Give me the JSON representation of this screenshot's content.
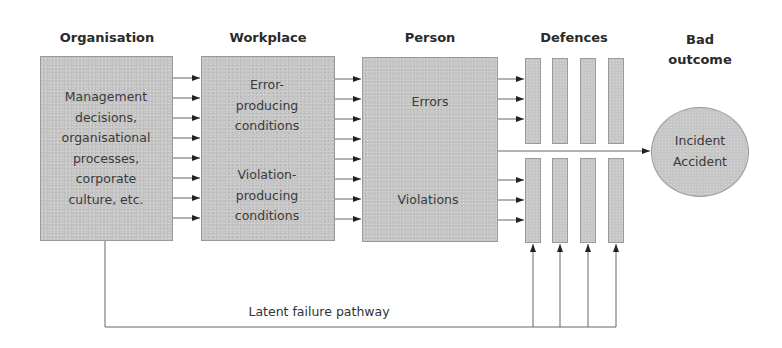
{
  "diagram": {
    "headers": {
      "organisation": "Organisation",
      "workplace": "Workplace",
      "person": "Person",
      "defences": "Defences",
      "bad_outcome_line1": "Bad",
      "bad_outcome_line2": "outcome"
    },
    "organisation_box": {
      "lines": [
        "Management",
        "decisions,",
        "organisational",
        "processes,",
        "corporate",
        "culture, etc."
      ]
    },
    "workplace_box": {
      "error_lines": [
        "Error-",
        "producing",
        "conditions"
      ],
      "violation_lines": [
        "Violation-",
        "producing",
        "conditions"
      ]
    },
    "person_box": {
      "errors": "Errors",
      "violations": "Violations"
    },
    "outcome_circle": {
      "line1": "Incident",
      "line2": "Accident"
    },
    "latent_pathway_label": "Latent failure pathway",
    "defence_columns": 4,
    "colors": {
      "box_fill": "#c6c6c6",
      "box_border": "#9a9a9a",
      "line": "#555555",
      "text": "#2e2e2e"
    }
  }
}
